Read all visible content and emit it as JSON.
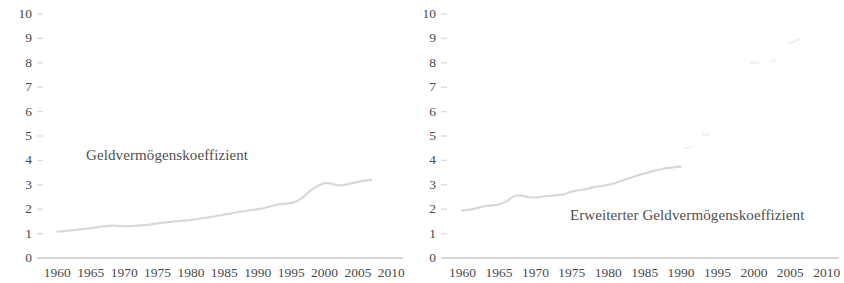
{
  "figure": {
    "background": "#ffffff",
    "text_color": "#4a4a4a",
    "line_color": "#d8d8d8",
    "axis_color": "#d5d5d5",
    "faded_color": "#efefef"
  },
  "chart_data": [
    {
      "type": "line",
      "title": "",
      "panel": "left",
      "series_label": "Geldvermögenskoeffizient",
      "xlabel": "",
      "ylabel": "",
      "xlim": [
        1958,
        2011
      ],
      "ylim": [
        0,
        10
      ],
      "grid": false,
      "legend_position": "inline",
      "y_ticks": [
        0,
        1,
        2,
        3,
        4,
        5,
        6,
        7,
        8,
        9,
        10
      ],
      "y_tick_labels": [
        "0",
        "1",
        "2",
        "3",
        "4",
        "5",
        "6",
        "7",
        "8",
        "9",
        "10"
      ],
      "x_ticks": [
        1960,
        1965,
        1970,
        1975,
        1980,
        1985,
        1990,
        1995,
        2000,
        2005,
        2010
      ],
      "x_tick_labels": [
        "1960",
        "1965",
        "1970",
        "1975",
        "1980",
        "1985",
        "1990",
        "1995",
        "2000",
        "2005",
        "2010"
      ],
      "x": [
        1960,
        1961,
        1962,
        1963,
        1964,
        1965,
        1966,
        1967,
        1968,
        1969,
        1970,
        1971,
        1972,
        1973,
        1974,
        1975,
        1976,
        1977,
        1978,
        1979,
        1980,
        1981,
        1982,
        1983,
        1984,
        1985,
        1986,
        1987,
        1988,
        1989,
        1990,
        1991,
        1992,
        1993,
        1994,
        1995,
        1996,
        1997,
        1998,
        1999,
        2000,
        2001,
        2002,
        2003,
        2004,
        2005,
        2006,
        2007
      ],
      "values": [
        1.08,
        1.1,
        1.13,
        1.16,
        1.19,
        1.22,
        1.26,
        1.3,
        1.33,
        1.32,
        1.3,
        1.31,
        1.33,
        1.35,
        1.38,
        1.42,
        1.45,
        1.48,
        1.51,
        1.53,
        1.56,
        1.6,
        1.64,
        1.68,
        1.73,
        1.78,
        1.83,
        1.88,
        1.92,
        1.96,
        2.0,
        2.05,
        2.12,
        2.2,
        2.22,
        2.25,
        2.35,
        2.55,
        2.78,
        2.95,
        3.07,
        3.05,
        2.98,
        3.0,
        3.06,
        3.12,
        3.17,
        3.2
      ]
    },
    {
      "type": "line",
      "title": "",
      "panel": "right",
      "series_label": "Erweiterter Geldvermögenskoeffizient",
      "xlabel": "",
      "ylabel": "",
      "xlim": [
        1958,
        2011
      ],
      "ylim": [
        0,
        10
      ],
      "grid": false,
      "legend_position": "inline",
      "y_ticks": [
        0,
        1,
        2,
        3,
        4,
        5,
        6,
        7,
        8,
        9,
        10
      ],
      "y_tick_labels": [
        "0",
        "1",
        "2",
        "3",
        "4",
        "5",
        "6",
        "7",
        "8",
        "9",
        "10"
      ],
      "x_ticks": [
        1960,
        1965,
        1970,
        1975,
        1980,
        1985,
        1990,
        1995,
        2000,
        2005,
        2010
      ],
      "x_tick_labels": [
        "1960",
        "1965",
        "1970",
        "1975",
        "1980",
        "1985",
        "1990",
        "1995",
        "2000",
        "2005",
        "2010"
      ],
      "x": [
        1960,
        1961,
        1962,
        1963,
        1964,
        1965,
        1966,
        1967,
        1968,
        1969,
        1970,
        1971,
        1972,
        1973,
        1974,
        1975,
        1976,
        1977,
        1978,
        1979,
        1980,
        1981,
        1982,
        1983,
        1984,
        1985,
        1986,
        1987,
        1988,
        1989,
        1990
      ],
      "values": [
        1.95,
        1.98,
        2.05,
        2.12,
        2.16,
        2.2,
        2.32,
        2.52,
        2.56,
        2.5,
        2.48,
        2.52,
        2.55,
        2.58,
        2.62,
        2.72,
        2.78,
        2.82,
        2.9,
        2.95,
        3.0,
        3.08,
        3.18,
        3.28,
        3.38,
        3.46,
        3.55,
        3.62,
        3.68,
        3.72,
        3.75
      ],
      "faded_segments": [
        {
          "x": [
            1990.5,
            1991.5
          ],
          "values": [
            4.5,
            4.55
          ],
          "note": "faint fragment"
        },
        {
          "x": [
            1993.0,
            1993.8
          ],
          "values": [
            5.05,
            5.05
          ],
          "note": "faint fragment"
        },
        {
          "x": [
            1999.5,
            2000.6
          ],
          "values": [
            8.0,
            8.0
          ],
          "note": "faint fragment"
        },
        {
          "x": [
            2002.3,
            2003.0
          ],
          "values": [
            8.05,
            8.1
          ],
          "note": "faint fragment"
        },
        {
          "x": [
            2004.8,
            2006.2
          ],
          "values": [
            8.8,
            8.95
          ],
          "note": "faint fragment"
        }
      ]
    }
  ]
}
